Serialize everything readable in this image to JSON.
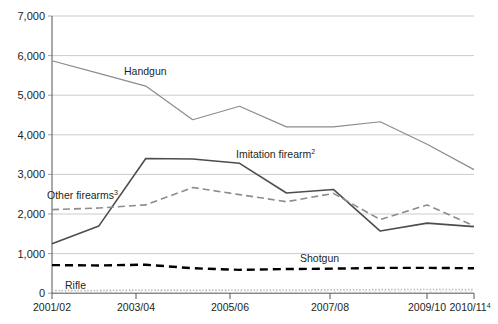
{
  "chart_data": {
    "type": "line",
    "title": "",
    "subtitle": "",
    "xlabel": "",
    "ylabel": "",
    "ylim": [
      0,
      7000
    ],
    "ytick_values": [
      0,
      1000,
      2000,
      3000,
      4000,
      5000,
      6000,
      7000
    ],
    "ytick_labels": [
      "0",
      "1,000",
      "2,000",
      "3,000",
      "4,000",
      "5,000",
      "6,000",
      "7,000"
    ],
    "grid": true,
    "legend_position": "inline-labels",
    "x": [
      "2001/02",
      "2002/03",
      "2003/04",
      "2004/05",
      "2005/06",
      "2006/07",
      "2007/08",
      "2008/09",
      "2009/10",
      "2010/11"
    ],
    "xtick_labels": [
      "2001/02",
      "2003/04",
      "2005/06",
      "2007/08",
      "2009/10",
      "2010/11"
    ],
    "xtick_label_4": "2010/11",
    "xtick_label_4_sup": "4",
    "series": [
      {
        "name": "Handgun",
        "label": "Handgun",
        "label_sup": "",
        "color": "#8c8c8c",
        "style": "solid",
        "width": 1.2,
        "values": [
          5870,
          5550,
          5230,
          4380,
          4720,
          4200,
          4200,
          4330,
          3760,
          3120
        ]
      },
      {
        "name": "Imitation firearm",
        "label": "Imitation firearm",
        "label_sup": "2",
        "color": "#4d4d4d",
        "style": "solid",
        "width": 1.6,
        "values": [
          1250,
          1700,
          3400,
          3390,
          3280,
          2530,
          2620,
          1570,
          1770,
          1680
        ]
      },
      {
        "name": "Other firearms",
        "label": "Other firearms",
        "label_sup": "3",
        "color": "#8c8c8c",
        "style": "dashed",
        "width": 1.6,
        "values": [
          2110,
          2150,
          2230,
          2670,
          2490,
          2310,
          2520,
          1860,
          2230,
          1700
        ]
      },
      {
        "name": "Shotgun",
        "label": "Shotgun",
        "label_sup": "",
        "color": "#000000",
        "style": "dashed-thick",
        "width": 2.4,
        "values": [
          710,
          700,
          720,
          630,
          590,
          610,
          620,
          640,
          640,
          630
        ]
      },
      {
        "name": "Rifle",
        "label": "Rifle",
        "label_sup": "",
        "color": "#b9b9b9",
        "style": "dotted",
        "width": 1.6,
        "values": [
          70,
          70,
          80,
          75,
          80,
          80,
          85,
          90,
          95,
          90
        ]
      }
    ],
    "annotations": [
      {
        "text": "Handgun",
        "x": 124,
        "y": 75
      },
      {
        "text": "Imitation firearm",
        "sup": "2",
        "x": 236,
        "y": 156
      },
      {
        "text": "Other firearms",
        "sup": "3",
        "x": 47,
        "y": 196
      },
      {
        "text": "Shotgun",
        "x": 300,
        "y": 261
      },
      {
        "text": "Rifle",
        "x": 65,
        "y": 288
      }
    ]
  }
}
